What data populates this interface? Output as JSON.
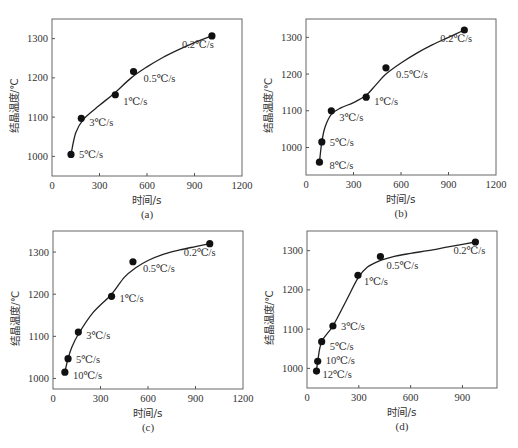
{
  "chart_data": [
    {
      "id": "a",
      "type": "scatter",
      "caption": "(a)",
      "xlabel": "时间/s",
      "ylabel": "结晶温度/℃",
      "xlim": [
        0,
        1200
      ],
      "ylim": [
        950,
        1350
      ],
      "xticks": [
        0,
        300,
        600,
        900,
        1200
      ],
      "yticks": [
        1000,
        1100,
        1200,
        1300
      ],
      "grid": false,
      "points": [
        {
          "label": "5℃/s",
          "x": 120,
          "y": 1005
        },
        {
          "label": "3℃/s",
          "x": 185,
          "y": 1097
        },
        {
          "label": "1℃/s",
          "x": 400,
          "y": 1157
        },
        {
          "label": "0.5℃/s",
          "x": 515,
          "y": 1216
        },
        {
          "label": "0.2℃/s",
          "x": 1010,
          "y": 1307
        }
      ],
      "curve": [
        [
          120,
          1005
        ],
        [
          150,
          1060
        ],
        [
          200,
          1095
        ],
        [
          300,
          1130
        ],
        [
          400,
          1163
        ],
        [
          500,
          1200
        ],
        [
          600,
          1228
        ],
        [
          700,
          1252
        ],
        [
          800,
          1272
        ],
        [
          900,
          1290
        ],
        [
          1010,
          1307
        ]
      ]
    },
    {
      "id": "b",
      "type": "scatter",
      "caption": "(b)",
      "xlabel": "时间/s",
      "ylabel": "结晶温度/℃",
      "xlim": [
        0,
        1200
      ],
      "ylim": [
        925,
        1350
      ],
      "xticks": [
        0,
        300,
        600,
        900,
        1200
      ],
      "yticks": [
        1000,
        1100,
        1200,
        1300
      ],
      "grid": false,
      "points": [
        {
          "label": "8℃/s",
          "x": 85,
          "y": 960
        },
        {
          "label": "5℃/s",
          "x": 100,
          "y": 1015
        },
        {
          "label": "3℃/s",
          "x": 160,
          "y": 1100
        },
        {
          "label": "1℃/s",
          "x": 380,
          "y": 1137
        },
        {
          "label": "0.5℃/s",
          "x": 505,
          "y": 1217
        },
        {
          "label": "0.2℃/s",
          "x": 1000,
          "y": 1320
        }
      ],
      "curve": [
        [
          85,
          960
        ],
        [
          100,
          1015
        ],
        [
          120,
          1055
        ],
        [
          160,
          1090
        ],
        [
          220,
          1108
        ],
        [
          300,
          1122
        ],
        [
          380,
          1142
        ],
        [
          440,
          1170
        ],
        [
          505,
          1200
        ],
        [
          600,
          1230
        ],
        [
          700,
          1257
        ],
        [
          800,
          1280
        ],
        [
          900,
          1300
        ],
        [
          1000,
          1320
        ]
      ]
    },
    {
      "id": "c",
      "type": "scatter",
      "caption": "(c)",
      "xlabel": "时间/s",
      "ylabel": "结晶温度/℃",
      "xlim": [
        0,
        1200
      ],
      "ylim": [
        975,
        1350
      ],
      "xticks": [
        0,
        300,
        600,
        900,
        1200
      ],
      "yticks": [
        1000,
        1100,
        1200,
        1300
      ],
      "grid": false,
      "points": [
        {
          "label": "10℃/s",
          "x": 75,
          "y": 1015
        },
        {
          "label": "5℃/s",
          "x": 95,
          "y": 1047
        },
        {
          "label": "3℃/s",
          "x": 160,
          "y": 1110
        },
        {
          "label": "1℃/s",
          "x": 370,
          "y": 1195
        },
        {
          "label": "0.5℃/s",
          "x": 505,
          "y": 1277
        },
        {
          "label": "0.2℃/s",
          "x": 990,
          "y": 1320
        }
      ],
      "curve": [
        [
          75,
          1015
        ],
        [
          95,
          1047
        ],
        [
          120,
          1075
        ],
        [
          160,
          1105
        ],
        [
          250,
          1155
        ],
        [
          370,
          1200
        ],
        [
          450,
          1240
        ],
        [
          520,
          1262
        ],
        [
          600,
          1280
        ],
        [
          700,
          1295
        ],
        [
          800,
          1305
        ],
        [
          900,
          1313
        ],
        [
          990,
          1320
        ]
      ]
    },
    {
      "id": "d",
      "type": "scatter",
      "caption": "(d)",
      "xlabel": "时间/s",
      "ylabel": "结晶温度/℃",
      "xlim": [
        0,
        1100
      ],
      "ylim": [
        950,
        1350
      ],
      "xticks": [
        0,
        300,
        600,
        900
      ],
      "yticks": [
        1000,
        1100,
        1200,
        1300
      ],
      "grid": false,
      "points": [
        {
          "label": "12℃/s",
          "x": 55,
          "y": 993
        },
        {
          "label": "10℃/s",
          "x": 62,
          "y": 1018
        },
        {
          "label": "5℃/s",
          "x": 85,
          "y": 1068
        },
        {
          "label": "3℃/s",
          "x": 150,
          "y": 1108
        },
        {
          "label": "1℃/s",
          "x": 295,
          "y": 1237
        },
        {
          "label": "0.5℃/s",
          "x": 425,
          "y": 1285
        },
        {
          "label": "0.2℃/s",
          "x": 975,
          "y": 1322
        }
      ],
      "curve": [
        [
          55,
          993
        ],
        [
          62,
          1018
        ],
        [
          85,
          1068
        ],
        [
          150,
          1108
        ],
        [
          230,
          1175
        ],
        [
          295,
          1230
        ],
        [
          350,
          1258
        ],
        [
          425,
          1275
        ],
        [
          500,
          1285
        ],
        [
          600,
          1293
        ],
        [
          700,
          1300
        ],
        [
          800,
          1308
        ],
        [
          900,
          1316
        ],
        [
          975,
          1322
        ]
      ]
    }
  ],
  "panels": [
    {
      "caption": "(a)",
      "xlabel": "时间/s",
      "ylabel": "结晶温度/℃"
    },
    {
      "caption": "(b)",
      "xlabel": "时间/s",
      "ylabel": "结晶温度/℃"
    },
    {
      "caption": "(c)",
      "xlabel": "时间/s",
      "ylabel": "结晶温度/℃"
    },
    {
      "caption": "(d)",
      "xlabel": "时间/s",
      "ylabel": "结晶温度/℃"
    }
  ],
  "layout": [
    {
      "left": 52,
      "top": 19,
      "right": 242,
      "bottom": 176
    },
    {
      "left": 306,
      "top": 19,
      "right": 496,
      "bottom": 175
    },
    {
      "left": 53,
      "top": 231,
      "right": 243,
      "bottom": 389
    },
    {
      "left": 307,
      "top": 231,
      "right": 497,
      "bottom": 388
    }
  ],
  "label_offsets": {
    "a": [
      [
        8,
        4
      ],
      [
        8,
        8
      ],
      [
        8,
        10
      ],
      [
        10,
        10
      ],
      [
        -30,
        12
      ]
    ],
    "b": [
      [
        10,
        7
      ],
      [
        8,
        4
      ],
      [
        8,
        10
      ],
      [
        8,
        8
      ],
      [
        10,
        10
      ],
      [
        -24,
        12
      ]
    ],
    "c": [
      [
        8,
        7
      ],
      [
        8,
        4
      ],
      [
        8,
        7
      ],
      [
        8,
        6
      ],
      [
        10,
        10
      ],
      [
        -26,
        12
      ]
    ],
    "d": [
      [
        6,
        7
      ],
      [
        8,
        3
      ],
      [
        8,
        8
      ],
      [
        8,
        4
      ],
      [
        6,
        10
      ],
      [
        6,
        12
      ],
      [
        -22,
        12
      ]
    ]
  }
}
